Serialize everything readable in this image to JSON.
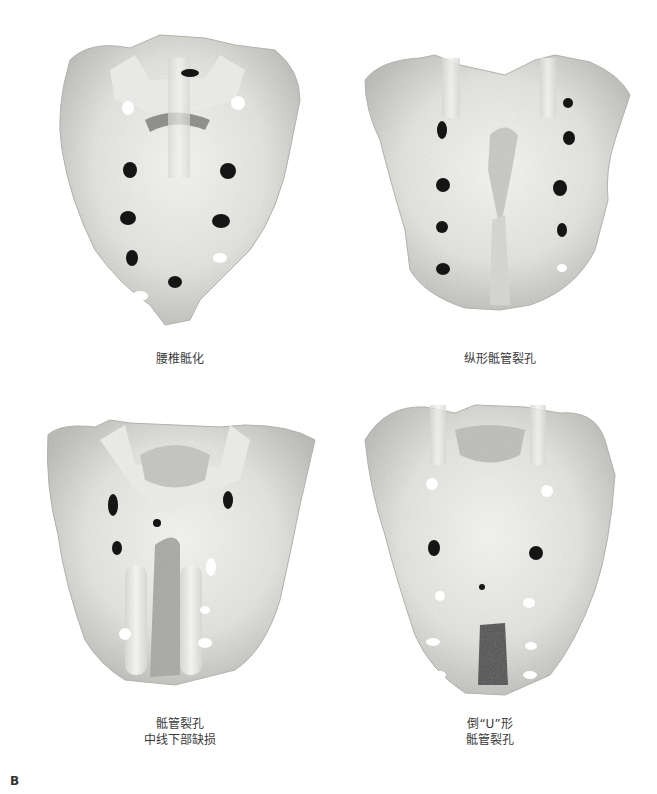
{
  "figure": {
    "label": "B",
    "panels": [
      {
        "id": "top-left",
        "caption_lines": [
          "腰椎骶化"
        ],
        "description": "sacrum with sacralized lumbar vertebra, dorsal view"
      },
      {
        "id": "top-right",
        "caption_lines": [
          "纵形骶管裂孔"
        ],
        "description": "sacrum with longitudinal sacral hiatus, dorsal view"
      },
      {
        "id": "bottom-left",
        "caption_lines": [
          "骶管裂孔",
          "中线下部缺损"
        ],
        "description": "sacral hiatus with lower midline defect, dorsal view"
      },
      {
        "id": "bottom-right",
        "caption_lines": [
          "倒“U”形",
          "骶管裂孔"
        ],
        "description": "inverted U-shaped sacral hiatus, dorsal view"
      }
    ]
  },
  "colors": {
    "background": "#ffffff",
    "bone_light": "#eeeeea",
    "bone_mid": "#cfcfcb",
    "bone_dark": "#9a9a96",
    "foramen": "#151515",
    "text": "#3a3a3a"
  }
}
